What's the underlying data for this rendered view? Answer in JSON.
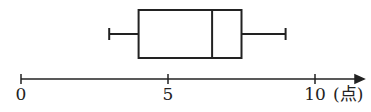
{
  "chart_data": {
    "type": "boxplot",
    "title": "",
    "xlabel": "",
    "unit_label": "(点)",
    "xlim": [
      0,
      10
    ],
    "ticks": [
      0,
      5,
      10
    ],
    "tick_labels": [
      "0",
      "5",
      "10"
    ],
    "grid": false,
    "series": [
      {
        "name": "",
        "min": 3,
        "q1": 4,
        "median": 6.5,
        "q3": 7.5,
        "max": 9
      }
    ]
  }
}
